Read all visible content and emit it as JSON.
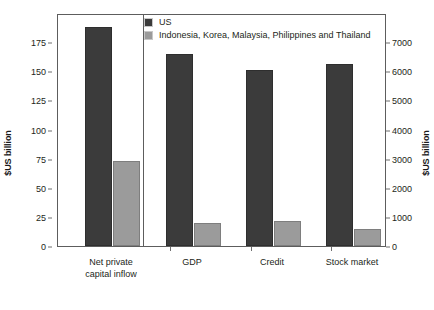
{
  "chart_data": {
    "type": "bar",
    "title": "",
    "xlabel": "",
    "ylabel": "$US billion",
    "y2label": "$US billion",
    "grid": false,
    "legend_position": "top-left-inside",
    "categories": [
      "Net private\ncapital inflow",
      "GDP",
      "Credit",
      "Stock market"
    ],
    "axis_assignment": [
      "left",
      "right",
      "right",
      "right"
    ],
    "left_axis": {
      "label": "$US billion",
      "ticks": [
        0,
        25,
        50,
        75,
        100,
        125,
        150,
        175
      ],
      "ylim": [
        0,
        200
      ]
    },
    "right_axis": {
      "label": "$US billion",
      "ticks": [
        0,
        1000,
        2000,
        3000,
        4000,
        5000,
        6000,
        7000
      ],
      "ylim": [
        0,
        8000
      ]
    },
    "series": [
      {
        "name": "US",
        "color": "#3b3b3b",
        "values": [
          188,
          6600,
          6050,
          6250
        ]
      },
      {
        "name": "Indonesia, Korea, Malaysia, Philippines and Thailand",
        "color": "#9b9b9b",
        "values": [
          73,
          800,
          850,
          600
        ]
      }
    ]
  },
  "legend": {
    "items": [
      {
        "label": "US",
        "color": "#3b3b3b"
      },
      {
        "label": "Indonesia, Korea, Malaysia, Philippines and Thailand",
        "color": "#9b9b9b"
      }
    ]
  },
  "axes": {
    "left_title": "$US billion",
    "right_title": "$US billion",
    "left_ticks": [
      "175",
      "150",
      "125",
      "100",
      "75",
      "50",
      "25",
      "0"
    ],
    "right_ticks": [
      "7000",
      "6000",
      "5000",
      "4000",
      "3000",
      "2000",
      "1000",
      "0"
    ]
  },
  "categories": [
    {
      "line1": "Net private",
      "line2": "capital inflow"
    },
    {
      "line1": "GDP",
      "line2": ""
    },
    {
      "line1": "Credit",
      "line2": ""
    },
    {
      "line1": "Stock market",
      "line2": ""
    }
  ]
}
